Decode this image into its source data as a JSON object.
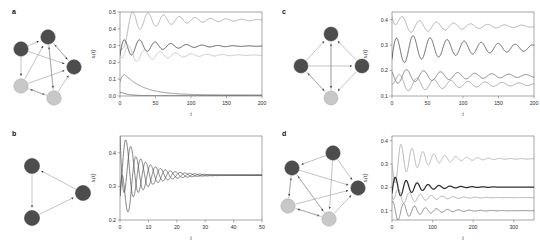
{
  "figure": {
    "type": "multi-panel-scientific-figure",
    "panels": [
      "a",
      "b",
      "c",
      "d"
    ]
  },
  "panel_a": {
    "letter": "a",
    "network": {
      "nodes": [
        {
          "id": "n1",
          "shade": "dark",
          "cx": 44,
          "cy": 23,
          "r": 7.2
        },
        {
          "id": "n2",
          "shade": "dark",
          "cx": 17,
          "cy": 35,
          "r": 7.2
        },
        {
          "id": "n3",
          "shade": "dark",
          "cx": 70,
          "cy": 53,
          "r": 7.2
        },
        {
          "id": "n4",
          "shade": "light",
          "cx": 17,
          "cy": 72,
          "r": 7.2
        },
        {
          "id": "n5",
          "shade": "light",
          "cx": 50,
          "cy": 84,
          "r": 7.2
        }
      ],
      "edges": [
        [
          "n2",
          "n1"
        ],
        [
          "n4",
          "n1"
        ],
        [
          "n5",
          "n1"
        ],
        [
          "n3",
          "n1"
        ],
        [
          "n2",
          "n4"
        ],
        [
          "n4",
          "n3"
        ],
        [
          "n5",
          "n3"
        ],
        [
          "n1",
          "n3"
        ],
        [
          "n4",
          "n5"
        ],
        [
          "n5",
          "n4"
        ],
        [
          "n2",
          "n3"
        ],
        [
          "n1",
          "n5"
        ]
      ]
    }
  },
  "panel_b": {
    "letter": "b",
    "network": {
      "nodes": [
        {
          "id": "n1",
          "shade": "dark",
          "cx": 26,
          "cy": 28,
          "r": 7.6
        },
        {
          "id": "n2",
          "shade": "dark",
          "cx": 26,
          "cy": 80,
          "r": 7.6
        },
        {
          "id": "n3",
          "shade": "dark",
          "cx": 77,
          "cy": 55,
          "r": 7.6
        }
      ],
      "edges": [
        [
          "n1",
          "n2"
        ],
        [
          "n2",
          "n3"
        ],
        [
          "n3",
          "n1"
        ]
      ]
    }
  },
  "panel_c": {
    "letter": "c",
    "network": {
      "nodes": [
        {
          "id": "n1",
          "shade": "dark",
          "cx": 45,
          "cy": 20,
          "r": 7.0
        },
        {
          "id": "n2",
          "shade": "dark",
          "cx": 15,
          "cy": 52,
          "r": 7.0
        },
        {
          "id": "n3",
          "shade": "dark",
          "cx": 76,
          "cy": 52,
          "r": 7.0
        },
        {
          "id": "n4",
          "shade": "light",
          "cx": 45,
          "cy": 84,
          "r": 7.0
        }
      ],
      "edges": [
        [
          "n2",
          "n1"
        ],
        [
          "n3",
          "n1"
        ],
        [
          "n4",
          "n1"
        ],
        [
          "n2",
          "n3"
        ],
        [
          "n4",
          "n2"
        ],
        [
          "n2",
          "n4"
        ],
        [
          "n3",
          "n4"
        ],
        [
          "n1",
          "n4"
        ]
      ]
    }
  },
  "panel_d": {
    "letter": "d",
    "network": {
      "nodes": [
        {
          "id": "n1",
          "shade": "dark",
          "cx": 59,
          "cy": 17,
          "r": 7.2
        },
        {
          "id": "n2",
          "shade": "dark",
          "cx": 18,
          "cy": 32,
          "r": 7.2
        },
        {
          "id": "n3",
          "shade": "dark",
          "cx": 84,
          "cy": 52,
          "r": 7.2
        },
        {
          "id": "n4",
          "shade": "light",
          "cx": 14,
          "cy": 70,
          "r": 7.2
        },
        {
          "id": "n5",
          "shade": "light",
          "cx": 55,
          "cy": 83,
          "r": 7.2
        }
      ],
      "edges": [
        [
          "n1",
          "n2"
        ],
        [
          "n4",
          "n2"
        ],
        [
          "n5",
          "n2"
        ],
        [
          "n2",
          "n3"
        ],
        [
          "n1",
          "n3"
        ],
        [
          "n5",
          "n3"
        ],
        [
          "n4",
          "n5"
        ],
        [
          "n5",
          "n4"
        ],
        [
          "n2",
          "n5"
        ],
        [
          "n1",
          "n5"
        ],
        [
          "n4",
          "n3"
        ],
        [
          "n2",
          "n4"
        ]
      ]
    }
  },
  "chart_data": [
    {
      "panel": "a",
      "type": "line",
      "title": "",
      "xlabel": "t",
      "ylabel": "xᵢ(t)",
      "xlim": [
        0,
        200
      ],
      "ylim": [
        0.0,
        0.5
      ],
      "xticks": [
        0,
        50,
        100,
        150,
        200
      ],
      "xtick_labels": [
        "0",
        "50",
        "100",
        "150",
        "200"
      ],
      "yticks": [
        0.0,
        0.1,
        0.2,
        0.3,
        0.4,
        0.5
      ],
      "ytick_labels": [
        "0.0",
        "0.1",
        "0.2",
        "0.3",
        "0.4",
        "0.5"
      ],
      "grid": false,
      "legend": "none",
      "series": [
        {
          "name": "x1",
          "color": "#9a9a9a",
          "width": 0.75,
          "start": 0.27,
          "asymptote": 0.452,
          "amplitude": 0.082,
          "period": 22,
          "damping": 62,
          "phase": 1.25
        },
        {
          "name": "x2",
          "color": "#3a3a3a",
          "width": 0.85,
          "start": 0.24,
          "asymptote": 0.297,
          "amplitude": 0.068,
          "period": 22,
          "damping": 48,
          "phase": -1.6
        },
        {
          "name": "x3",
          "color": "#b4b4b4",
          "width": 0.75,
          "start": 0.245,
          "asymptote": 0.243,
          "amplitude": 0.06,
          "period": 22,
          "damping": 52,
          "phase": 2.7
        },
        {
          "name": "x4",
          "color": "#6e6e6e",
          "width": 0.75,
          "start": 0.085,
          "asymptote": 0.006,
          "amplitude": 0.0,
          "period": 22,
          "damping": 26,
          "phase": 0,
          "decay": true,
          "peak": 0.135,
          "peak_t": 6
        },
        {
          "name": "x5",
          "color": "#555555",
          "width": 0.75,
          "start": 0.02,
          "asymptote": 0.002,
          "amplitude": 0.0,
          "period": 22,
          "damping": 10,
          "phase": 0,
          "decay": true,
          "peak": 0.022,
          "peak_t": 2
        }
      ]
    },
    {
      "panel": "b",
      "type": "line",
      "title": "",
      "xlabel": "t",
      "ylabel": "xᵢ(t)",
      "xlim": [
        0,
        50
      ],
      "ylim": [
        0.2,
        0.45
      ],
      "xticks": [
        0,
        10,
        20,
        30,
        40,
        50
      ],
      "xtick_labels": [
        "0",
        "10",
        "20",
        "30",
        "40",
        "50"
      ],
      "yticks": [
        0.2,
        0.3,
        0.4
      ],
      "ytick_labels": [
        "0.2",
        "0.3",
        "0.4"
      ],
      "grid": false,
      "legend": "none",
      "series": [
        {
          "name": "x1",
          "color": "#4a4a4a",
          "width": 0.7,
          "start": 0.455,
          "asymptote": 0.3335,
          "amplitude": 0.122,
          "period": 5.2,
          "damping": 7.8,
          "phase": 1.5708
        },
        {
          "name": "x2",
          "color": "#4a4a4a",
          "width": 0.7,
          "start": 0.272,
          "asymptote": 0.3335,
          "amplitude": 0.122,
          "period": 5.2,
          "damping": 7.8,
          "phase": -0.5236
        },
        {
          "name": "x3",
          "color": "#4a4a4a",
          "width": 0.7,
          "start": 0.272,
          "asymptote": 0.3335,
          "amplitude": 0.122,
          "period": 5.2,
          "damping": 7.8,
          "phase": -2.618
        }
      ]
    },
    {
      "panel": "c",
      "type": "line",
      "title": "",
      "xlabel": "t",
      "ylabel": "xᵢ(t)",
      "xlim": [
        0,
        200
      ],
      "ylim": [
        0.1,
        0.43
      ],
      "xticks": [
        0,
        50,
        100,
        150,
        200
      ],
      "xtick_labels": [
        "0",
        "50",
        "100",
        "150",
        "200"
      ],
      "yticks": [
        0.1,
        0.2,
        0.3,
        0.4
      ],
      "ytick_labels": [
        "0.1",
        "0.2",
        "0.3",
        "0.4"
      ],
      "grid": false,
      "legend": "none",
      "series": [
        {
          "name": "x1",
          "color": "#9d9d9d",
          "width": 0.8,
          "start": 0.415,
          "asymptote": 0.374,
          "amplitude": 0.034,
          "period": 24,
          "damping": 88,
          "phase": 2.4
        },
        {
          "name": "x2",
          "color": "#3f3f3f",
          "width": 0.8,
          "start": 0.245,
          "asymptote": 0.289,
          "amplitude": 0.062,
          "period": 24,
          "damping": 120,
          "phase": -1.5
        },
        {
          "name": "x3",
          "color": "#5c5c5c",
          "width": 0.75,
          "start": 0.195,
          "asymptote": 0.179,
          "amplitude": 0.03,
          "period": 24,
          "damping": 110,
          "phase": 0.9
        },
        {
          "name": "x4",
          "color": "#8a8a8a",
          "width": 0.75,
          "start": 0.148,
          "asymptote": 0.146,
          "amplitude": 0.034,
          "period": 24,
          "damping": 100,
          "phase": -2.9
        }
      ]
    },
    {
      "panel": "d",
      "type": "line",
      "title": "",
      "xlabel": "t",
      "ylabel": "xᵢ(t)",
      "xlim": [
        0,
        350
      ],
      "ylim": [
        0.06,
        0.42
      ],
      "xticks": [
        0,
        100,
        200,
        300
      ],
      "xtick_labels": [
        "0",
        "100",
        "200",
        "300"
      ],
      "yticks": [
        0.1,
        0.2,
        0.3,
        0.4
      ],
      "ytick_labels": [
        "0.1",
        "0.2",
        "0.3",
        "0.4"
      ],
      "grid": false,
      "legend": "none",
      "series": [
        {
          "name": "x1",
          "color": "#a0a0a0",
          "width": 0.75,
          "start": 0.3,
          "asymptote": 0.322,
          "amplitude": 0.09,
          "period": 27,
          "damping": 72,
          "phase": 1.1
        },
        {
          "name": "x2",
          "color": "#2e2e2e",
          "width": 1.25,
          "start": 0.175,
          "asymptote": 0.201,
          "amplitude": 0.052,
          "period": 27,
          "damping": 58,
          "phase": -1.9
        },
        {
          "name": "x3",
          "color": "#909090",
          "width": 0.7,
          "start": 0.165,
          "asymptote": 0.156,
          "amplitude": 0.04,
          "period": 27,
          "damping": 66,
          "phase": 2.6
        },
        {
          "name": "x4",
          "color": "#5a5a5a",
          "width": 0.7,
          "start": 0.135,
          "asymptote": 0.1,
          "amplitude": 0.048,
          "period": 27,
          "damping": 62,
          "phase": -0.4
        }
      ]
    }
  ],
  "style": {
    "node_dark": "#4d4d4d",
    "node_light": "#c8c8c8",
    "node_stroke": "#3a3a3a",
    "edge_color": "#9b9b9b",
    "axis_color": "#6b6b6b",
    "background": "#ffffff"
  }
}
